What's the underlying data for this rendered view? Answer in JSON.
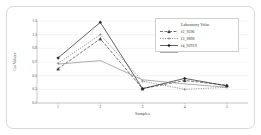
{
  "chart_data": {
    "type": "line",
    "title": "",
    "xlabel": "Samples",
    "ylabel": "Cu Values",
    "categories": [
      "1",
      "2",
      "3",
      "4",
      "5"
    ],
    "x": [
      1,
      2,
      3,
      4,
      5
    ],
    "xlim": [
      0.5,
      5.5
    ],
    "ylim": [
      0.1,
      1.3
    ],
    "grid": true,
    "grid_axis": "y",
    "legend_position": "top-right",
    "ytick_labels": [
      "1.3",
      "1.1",
      "0.9",
      "0.7",
      "0.5",
      "0.3",
      "0.1"
    ],
    "ytick_values": [
      1.3,
      1.1,
      0.9,
      0.7,
      0.5,
      0.3,
      0.1
    ],
    "xtick_labels": [
      "1",
      "2",
      "3",
      "4",
      "5"
    ],
    "series": [
      {
        "name": "Laboratory Value",
        "values": [
          0.6,
          1.04,
          0.31,
          0.43,
          0.36
        ],
        "color": "#3a3a3a",
        "dash": "3,1.5",
        "marker": "triangle"
      },
      {
        "name": "f2_9596",
        "values": [
          0.68,
          1.1,
          0.42,
          0.3,
          0.33
        ],
        "color": "#6e6e6e",
        "dash": "1.2,1.2",
        "marker": "plus"
      },
      {
        "name": "f3_9898",
        "values": [
          0.76,
          1.28,
          0.31,
          0.46,
          0.35
        ],
        "color": "#1f1f1f",
        "dash": "none",
        "marker": "diamond"
      },
      {
        "name": "f4_92919",
        "values": [
          0.67,
          0.72,
          0.44,
          0.38,
          0.33
        ],
        "color": "#8a8a8a",
        "dash": "none",
        "marker": "none"
      }
    ]
  },
  "legend": {
    "entries": [
      {
        "label": "Laboratory Value"
      },
      {
        "label": "f2_9596"
      },
      {
        "label": "f3_9898"
      },
      {
        "label": "f4_92919"
      }
    ]
  },
  "axes": {
    "x_title": "Samples",
    "y_title": "Cu Values"
  }
}
